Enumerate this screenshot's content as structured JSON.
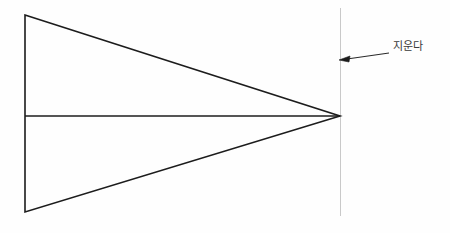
{
  "drawing": {
    "title": "wedge-with-erase-annotation",
    "background_color": "#fefefe",
    "line_color": "#1c1c1c",
    "reference_line_color": "#c9c9c9",
    "leader_color": "#2a2a2a",
    "label_color": "#3a3a3a",
    "annotation": {
      "text": "지운다",
      "label_x": 393,
      "label_y": 47,
      "leader": {
        "from_x": 389,
        "from_y": 53,
        "to_x": 341,
        "to_y": 60,
        "arrowhead": "left-arrow-icon"
      }
    },
    "shapes": {
      "triangle": {
        "name": "wedge-triangle",
        "points": "25,15 340,116 25,212",
        "top_left_x": 25,
        "top_left_y": 15,
        "bottom_left_x": 25,
        "bottom_left_y": 212,
        "apex_x": 340,
        "apex_y": 116,
        "stroke_width": 1.6
      },
      "centerline": {
        "name": "horizontal-centerline",
        "x1": 25,
        "y1": 116,
        "x2": 340,
        "y2": 116,
        "stroke_width": 1.5
      },
      "reference_line": {
        "name": "vertical-reference-line",
        "x1": 340,
        "y1": 8,
        "x2": 340,
        "y2": 216,
        "stroke_width": 1
      }
    }
  }
}
